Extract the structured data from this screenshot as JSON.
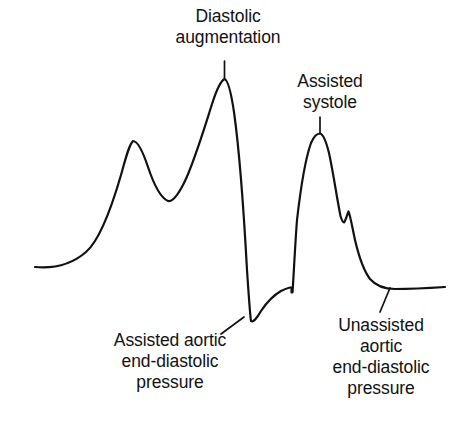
{
  "figure": {
    "type": "medical-waveform-diagram",
    "background_color": "#ffffff",
    "stroke_color": "#111111",
    "text_color": "#111111"
  },
  "annotations": {
    "diastolic_augmentation": {
      "lines": [
        "Diastolic",
        "augmentation"
      ],
      "line1": "Diastolic",
      "line2": "augmentation"
    },
    "assisted_systole": {
      "lines": [
        "Assisted",
        "systole"
      ],
      "line1": "Assisted",
      "line2": "systole"
    },
    "assisted_aortic_edp": {
      "lines": [
        "Assisted aortic",
        "end-diastolic",
        "pressure"
      ],
      "line1": "Assisted aortic",
      "line2": "end-diastolic",
      "line3": "pressure"
    },
    "unassisted_aortic_edp": {
      "lines": [
        "Unassisted",
        "aortic",
        "end-diastolic",
        "pressure"
      ],
      "line1": "Unassisted",
      "line2": "aortic",
      "line3": "end-diastolic",
      "line4": "pressure"
    }
  },
  "chart_data": {
    "type": "line",
    "title": "",
    "xlabel": "",
    "ylabel": "",
    "grid": false,
    "legend": "none",
    "axes_visible": false,
    "xlim": [
      0,
      452
    ],
    "ylim": [
      433,
      0
    ],
    "note": "Arterial pressure waveform during intra-aortic balloon counterpulsation; y pixel coordinates, smaller y = higher pressure",
    "series": [
      {
        "name": "arterial-pressure-waveform",
        "stroke": "#111111",
        "stroke_width": 2.2,
        "path": "M 35 267 C 52 268.5 70 266 86 252 C 100 240 112 206 121 175 C 126 157 129 145 133 141 C 138 141 143 152 148 167 C 154 185 161 198 168 201 C 173 202 178 195 184 183 C 194 163 204 129 213 101 C 217 89 221 81 224.5 79 C 228 80 231 92 234 112 C 239 148 244 215 247 270 C 249 300 250 315 251 321 C 253 323 257 318 261 311 C 267 302 274 295 281 291 C 285 289 288 288 290 287.5 L 291.5 287.5 L 291.5 292.5 L 292.5 292.5 C 293.5 279 295 246 297 220 C 301 185 306 157 311 143 C 314 136 317 133.5 320 133.5 C 323 134 326 141 329 153 C 333 171 337 199 340.5 216 C 342 221 343 222.5 344 222.5 C 345.5 221 347 215 348.5 211.5 C 350 214 352 226 355 240 C 359 257 364 271 370 279 C 377 287 385 289 395 289 C 412 289 430 288 445 287"
      }
    ],
    "features": [
      {
        "name": "unassisted-systolic-peak",
        "x": 133,
        "y": 141,
        "label": ""
      },
      {
        "name": "dicrotic-valley",
        "x": 169,
        "y": 201,
        "label": ""
      },
      {
        "name": "diastolic-augmentation-peak",
        "x": 224,
        "y": 79,
        "label": "Diastolic augmentation"
      },
      {
        "name": "assisted-aortic-end-diastolic-pressure",
        "x": 249,
        "y": 322,
        "label": "Assisted aortic end-diastolic pressure"
      },
      {
        "name": "assisted-systole-peak",
        "x": 320,
        "y": 134,
        "label": "Assisted systole"
      },
      {
        "name": "dicrotic-notch",
        "x": 344,
        "y": 222,
        "label": ""
      },
      {
        "name": "unassisted-aortic-end-diastolic-pressure",
        "x": 389,
        "y": 288,
        "label": "Unassisted aortic end-diastolic pressure"
      }
    ],
    "leader_lines": [
      {
        "name": "leader-diastolic-augmentation",
        "x1": 224.5,
        "y1": 61,
        "x2": 224.5,
        "y2": 78
      },
      {
        "name": "leader-assisted-systole",
        "x1": 320,
        "y1": 117,
        "x2": 320,
        "y2": 133
      },
      {
        "name": "leader-assisted-aortic-edp",
        "x1": 221,
        "y1": 334,
        "x2": 244,
        "y2": 317
      },
      {
        "name": "leader-unassisted-aortic-edp",
        "x1": 380,
        "y1": 312,
        "x2": 390,
        "y2": 288
      }
    ]
  }
}
